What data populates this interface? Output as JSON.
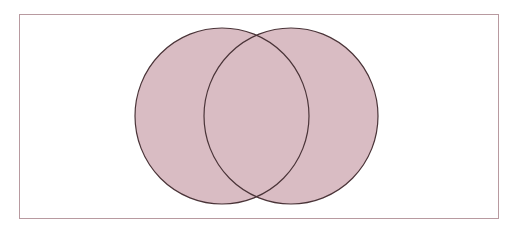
{
  "diagram": {
    "type": "venn",
    "title": "",
    "shaded_region": "A ∪ B",
    "colors": {
      "background": "#ffffff",
      "frame": "#b89aa0",
      "fill": "#d9bcc3",
      "outline": "#4a3438"
    },
    "universe": {
      "x": 19,
      "y": 14,
      "width": 479,
      "height": 204,
      "label": ""
    },
    "sets": [
      {
        "name": "A",
        "label": "",
        "cx": 222,
        "cy": 116,
        "rx": 87,
        "ry": 88
      },
      {
        "name": "B",
        "label": "",
        "cx": 291,
        "cy": 116,
        "rx": 87,
        "ry": 88
      }
    ]
  }
}
